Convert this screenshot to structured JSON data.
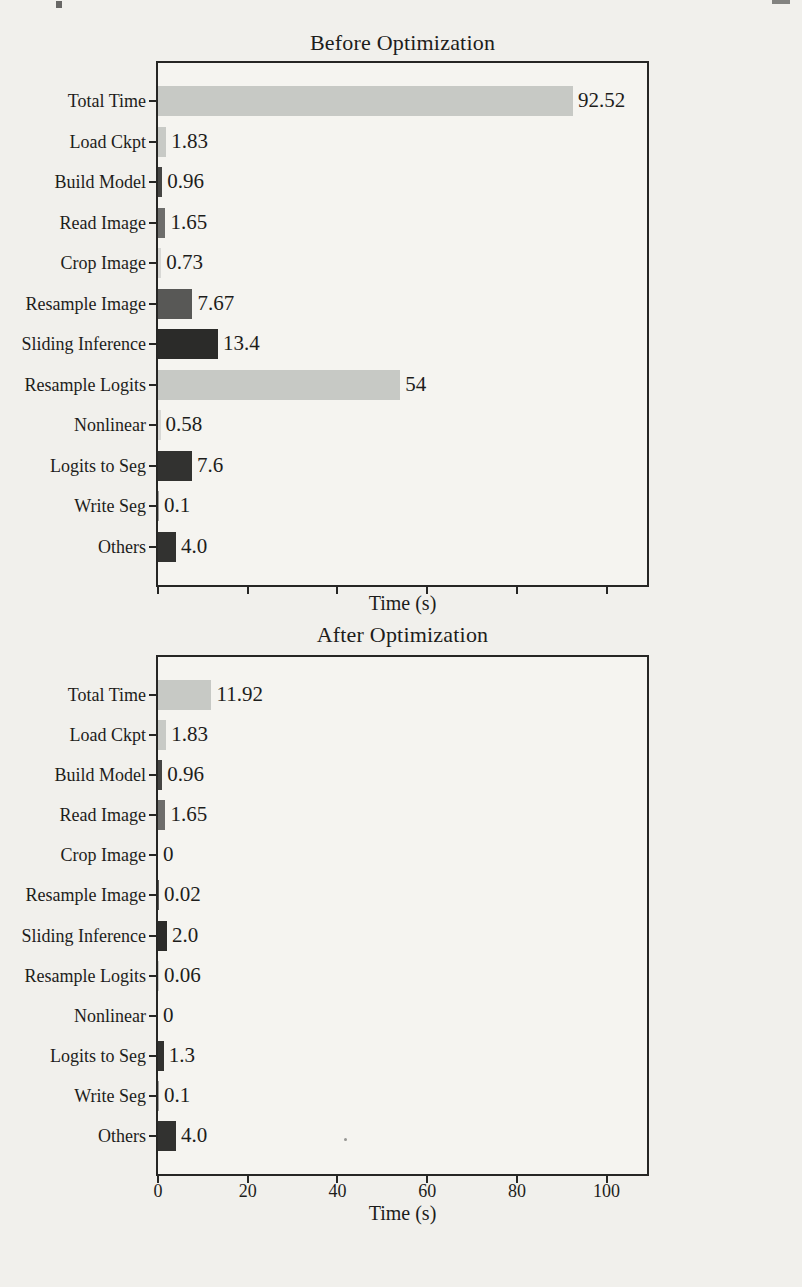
{
  "page": {
    "paper_color": "#f1f0ec",
    "plot_background": "#f5f4f0",
    "axis_color": "#262624",
    "text_color": "#1d1d1b"
  },
  "chart_data": [
    {
      "type": "bar",
      "orientation": "horizontal",
      "title": "Before Optimization",
      "xlabel": "Time (s)",
      "categories": [
        "Total Time",
        "Load Ckpt",
        "Build Model",
        "Read Image",
        "Crop Image",
        "Resample Image",
        "Sliding Inference",
        "Resample Logits",
        "Nonlinear",
        "Logits to Seg",
        "Write Seg",
        "Others"
      ],
      "values": [
        92.52,
        1.83,
        0.96,
        1.65,
        0.73,
        7.67,
        13.4,
        54,
        0.58,
        7.6,
        0.1,
        4.0
      ],
      "value_labels": [
        "92.52",
        "1.83",
        "0.96",
        "1.65",
        "0.73",
        "7.67",
        "13.4",
        "54",
        "0.58",
        "7.6",
        "0.1",
        "4.0"
      ],
      "bar_colors": [
        "#c7c9c5",
        "#c8cac6",
        "#454543",
        "#6d6d6b",
        "#d8d8d5",
        "#585856",
        "#2b2b29",
        "#c7c9c5",
        "#d8d8d5",
        "#323230",
        "#9a9a98",
        "#323230"
      ],
      "xlim": [
        0,
        109
      ],
      "x_ticks": [
        0,
        20,
        40,
        60,
        80,
        100
      ],
      "x_tick_labels": [],
      "show_x_tick_labels": false,
      "grid": false,
      "legend": null
    },
    {
      "type": "bar",
      "orientation": "horizontal",
      "title": "After Optimization",
      "xlabel": "Time (s)",
      "categories": [
        "Total Time",
        "Load Ckpt",
        "Build Model",
        "Read Image",
        "Crop Image",
        "Resample Image",
        "Sliding Inference",
        "Resample Logits",
        "Nonlinear",
        "Logits to Seg",
        "Write Seg",
        "Others"
      ],
      "values": [
        11.92,
        1.83,
        0.96,
        1.65,
        0,
        0.02,
        2.0,
        0.06,
        0,
        1.3,
        0.1,
        4.0
      ],
      "value_labels": [
        "11.92",
        "1.83",
        "0.96",
        "1.65",
        "0",
        "0.02",
        "2.0",
        "0.06",
        "0",
        "1.3",
        "0.1",
        "4.0"
      ],
      "bar_colors": [
        "#c7c9c5",
        "#c8cac6",
        "#454543",
        "#6d6d6b",
        "#d8d8d5",
        "#585856",
        "#2b2b29",
        "#c7c9c5",
        "#d8d8d5",
        "#323230",
        "#9a9a98",
        "#323230"
      ],
      "xlim": [
        0,
        109
      ],
      "x_ticks": [
        0,
        20,
        40,
        60,
        80,
        100
      ],
      "x_tick_labels": [
        "0",
        "20",
        "40",
        "60",
        "80",
        "100"
      ],
      "show_x_tick_labels": true,
      "grid": false,
      "legend": null
    }
  ]
}
